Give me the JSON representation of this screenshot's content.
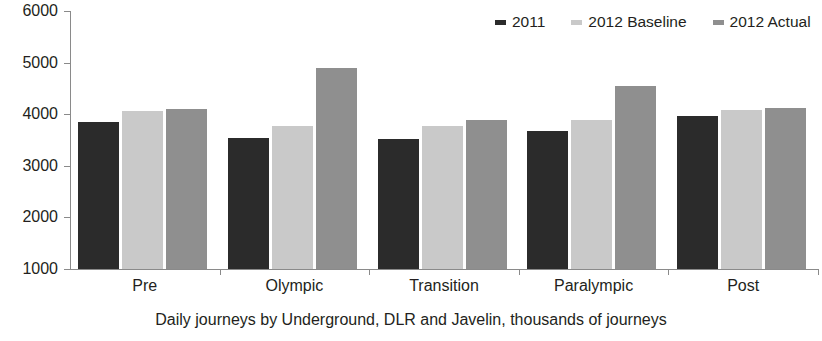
{
  "chart_data": {
    "type": "bar",
    "title": "",
    "subtitle": "",
    "xlabel": "Daily journeys by Underground, DLR and Javelin, thousands of journeys",
    "ylabel": "",
    "categories": [
      "Pre",
      "Olympic",
      "Transition",
      "Paralympic",
      "Post"
    ],
    "series": [
      {
        "name": "2011",
        "color": "#2b2b2b",
        "values": [
          3850,
          3540,
          3520,
          3670,
          3960
        ]
      },
      {
        "name": "2012 Baseline",
        "color": "#c9c9c9",
        "values": [
          4060,
          3770,
          3780,
          3890,
          4090
        ]
      },
      {
        "name": "2012 Actual",
        "color": "#8f8f8f",
        "values": [
          4110,
          4900,
          3880,
          4540,
          4120
        ]
      }
    ],
    "ylim": [
      1000,
      6000
    ],
    "yticks": [
      1000,
      2000,
      3000,
      4000,
      5000,
      6000
    ],
    "ytick_labels": [
      "1000",
      "2000",
      "3000",
      "4000",
      "5000",
      "6000"
    ],
    "grid": false,
    "legend_position": "top-right",
    "axis_color": "#8a8a8a",
    "text_color": "#231f20",
    "background": "#ffffff"
  },
  "legend": {
    "entries": [
      {
        "label": "2011"
      },
      {
        "label": "2012 Baseline"
      },
      {
        "label": "2012 Actual"
      }
    ]
  },
  "caption": {
    "text": "Daily journeys by Underground, DLR and Javelin, thousands of journeys"
  }
}
